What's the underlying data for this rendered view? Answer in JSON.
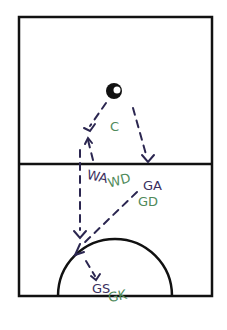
{
  "diagram": {
    "type": "netball court play diagram",
    "court": {
      "outline_color": "#111111"
    },
    "ball": {
      "label": "ball"
    },
    "positions": {
      "C": {
        "label": "C",
        "color": "#4f8a5a"
      },
      "WA": {
        "label": "WA",
        "color": "#3a2f5e"
      },
      "WD": {
        "label": "WD",
        "color": "#4f8a5a"
      },
      "GA": {
        "label": "GA",
        "color": "#3a2f5e"
      },
      "GD": {
        "label": "GD",
        "color": "#4f8a5a"
      },
      "GS": {
        "label": "GS",
        "color": "#3a2f5e"
      },
      "GK": {
        "label": "GK",
        "color": "#4f8a5a"
      }
    },
    "pass_color": "#2b2650",
    "passes": [
      {
        "from": "ball",
        "to": "WA-lead"
      },
      {
        "from": "ball",
        "to": "GA"
      },
      {
        "from": "WA",
        "to": "circle-edge"
      },
      {
        "from": "GA",
        "to": "circle-edge"
      },
      {
        "from": "circle-edge",
        "to": "GS"
      }
    ]
  }
}
